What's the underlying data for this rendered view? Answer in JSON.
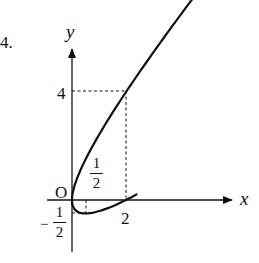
{
  "problem_number": "4.",
  "axes": {
    "x_label": "x",
    "y_label": "y",
    "origin_label": "O"
  },
  "ticks": {
    "y_four": "4",
    "x_two": "2",
    "half": {
      "numerator": "1",
      "denominator": "2"
    },
    "neg_half": {
      "sign": "−",
      "numerator": "1",
      "denominator": "2"
    }
  },
  "chart_data": {
    "type": "line",
    "title": "",
    "equation": "(y - x)^2 = 2x",
    "xlabel": "x",
    "ylabel": "y",
    "labeled_points": [
      {
        "x": 0,
        "y": 0,
        "label": "O"
      },
      {
        "x": 2,
        "y": 0,
        "label": "2"
      },
      {
        "x": 2,
        "y": 4,
        "label": "4"
      },
      {
        "x": 0.5,
        "y": -0.5,
        "label": "1/2, -1/2"
      }
    ],
    "series": [
      {
        "name": "upper branch y = x + sqrt(2x)",
        "x": [
          0,
          0.5,
          1,
          2,
          2.67
        ],
        "y": [
          0,
          1.5,
          2.41,
          4,
          4.98
        ]
      },
      {
        "name": "lower branch y = x - sqrt(2x)",
        "x": [
          0,
          0.5,
          1,
          2,
          3,
          4,
          5.48
        ],
        "y": [
          0,
          -0.5,
          -0.41,
          0,
          0.55,
          1.17,
          2.17
        ]
      }
    ],
    "dashed_guides": [
      {
        "from": [
          0,
          4
        ],
        "to": [
          2,
          4
        ]
      },
      {
        "from": [
          2,
          4
        ],
        "to": [
          2,
          0
        ]
      },
      {
        "from": [
          0.5,
          0
        ],
        "to": [
          0.5,
          -0.5
        ]
      },
      {
        "from": [
          0,
          -0.5
        ],
        "to": [
          0.5,
          -0.5
        ]
      }
    ],
    "grid": false
  }
}
